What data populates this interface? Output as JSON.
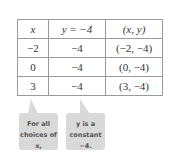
{
  "table": {
    "headers": [
      "x",
      "y = −4",
      "(x, y)"
    ],
    "rows": [
      [
        "−2",
        "−4",
        "(−2, −4)"
      ],
      [
        "0",
        "−4",
        "(0, −4)"
      ],
      [
        "3",
        "−4",
        "(3, −4)"
      ]
    ]
  },
  "callouts": [
    {
      "line1": "For all",
      "line2": "choices of x,"
    },
    {
      "line1": "y is a",
      "line2": "constant −4."
    }
  ]
}
